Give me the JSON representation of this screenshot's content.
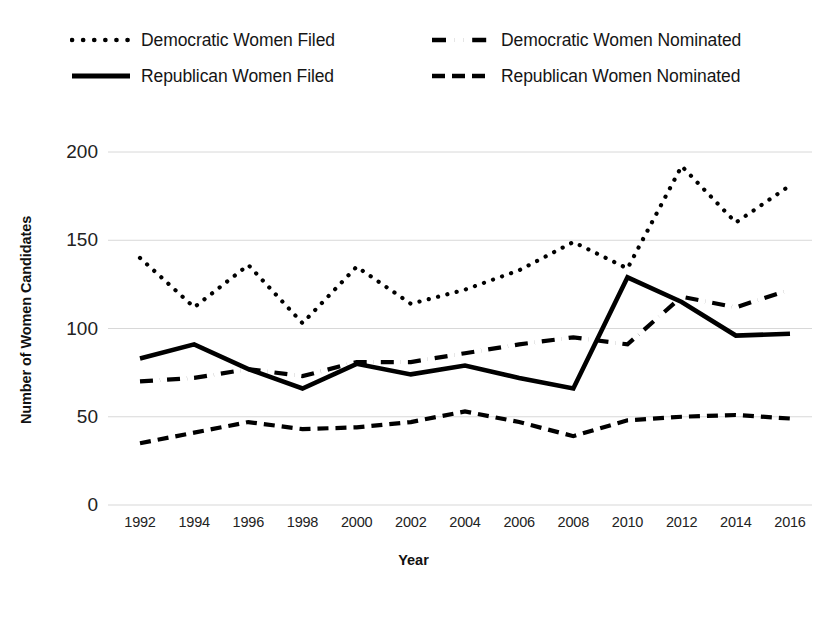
{
  "chart_data": {
    "type": "line",
    "title": "",
    "xlabel": "Year",
    "ylabel": "Number of Women Candidates",
    "categories": [
      1992,
      1994,
      1996,
      1998,
      2000,
      2002,
      2004,
      2006,
      2008,
      2010,
      2012,
      2014,
      2016
    ],
    "x_tick_labels": [
      "1992",
      "1994",
      "1996",
      "1998",
      "2000",
      "2002",
      "2004",
      "2006",
      "2008",
      "2010",
      "2012",
      "2014",
      "2016"
    ],
    "y_tick_labels": [
      "200",
      "150",
      "100",
      "50",
      "0"
    ],
    "y_ticks": [
      200,
      150,
      100,
      50,
      0
    ],
    "ylim": [
      0,
      200
    ],
    "grid": "horizontal",
    "legend_position": "top",
    "series": [
      {
        "name": "Democratic Women Filed",
        "style": "dotted",
        "color": "#000000",
        "values": [
          140,
          112,
          136,
          103,
          135,
          114,
          122,
          133,
          149,
          134,
          192,
          160,
          181
        ]
      },
      {
        "name": "Republican Women Filed",
        "style": "solid",
        "color": "#000000",
        "values": [
          83,
          91,
          77,
          66,
          80,
          74,
          79,
          72,
          66,
          129,
          115,
          96,
          97
        ]
      },
      {
        "name": "Democratic Women Nominated",
        "style": "dash-dot",
        "color": "#000000",
        "values": [
          70,
          72,
          77,
          73,
          81,
          81,
          86,
          91,
          95,
          91,
          118,
          112,
          122
        ]
      },
      {
        "name": "Republican Women Nominated",
        "style": "dashed",
        "color": "#000000",
        "values": [
          35,
          41,
          47,
          43,
          44,
          47,
          53,
          47,
          39,
          48,
          50,
          51,
          49
        ]
      }
    ]
  },
  "legend": {
    "items": [
      {
        "label": "Democratic Women Filed",
        "style": "dotted"
      },
      {
        "label": "Democratic Women Nominated",
        "style": "dash-dot"
      },
      {
        "label": "Republican Women Filed",
        "style": "solid"
      },
      {
        "label": "Republican Women Nominated",
        "style": "dashed"
      }
    ]
  },
  "axes": {
    "y_title": "Number of Women Candidates",
    "x_title": "Year"
  }
}
